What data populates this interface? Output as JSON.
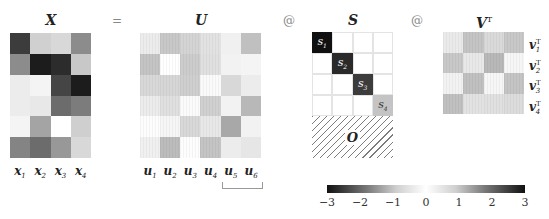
{
  "equation": {
    "titles": {
      "X": "X",
      "U": "U",
      "S": "S",
      "VT": "V",
      "VT_sup": "T"
    },
    "operators": {
      "equals": "=",
      "matmul1": "@",
      "matmul2": "@"
    }
  },
  "X": {
    "rows": 6,
    "cols": 4,
    "cells": [
      [
        "#3c3c3c",
        "#d0d0d0",
        "#d8d8d8",
        "#8c8c8c"
      ],
      [
        "#8c8c8c",
        "#1c1c1c",
        "#2c2c2c",
        "#c8c8c8"
      ],
      [
        "#ececec",
        "#f4f4f4",
        "#454545",
        "#1c1c1c"
      ],
      [
        "#ececec",
        "#e8e8e8",
        "#6c6c6c",
        "#7c7c7c"
      ],
      [
        "#f4f4f4",
        "#a4a4a4",
        "#ffffff",
        "#cfcfcf"
      ],
      [
        "#848484",
        "#6c6c6c",
        "#989898",
        "#d8d8d8"
      ]
    ],
    "col_labels": [
      {
        "base": "x",
        "sub": "1"
      },
      {
        "base": "x",
        "sub": "2"
      },
      {
        "base": "x",
        "sub": "3"
      },
      {
        "base": "x",
        "sub": "4"
      }
    ]
  },
  "U": {
    "rows": 6,
    "cols": 6,
    "hatched_cols": [
      4,
      5
    ],
    "cells": [
      [
        "#ececec",
        "#c8c8c8",
        "#d4d4d4",
        "#e2e2e2",
        "#f0f0f0",
        "#c0c0c0"
      ],
      [
        "#c4c4c4",
        "#ffffff",
        "#cccccc",
        "#e0e0e0",
        "#f2f2f2",
        "#f4f4f4"
      ],
      [
        "#d8d8d8",
        "#d6d6d6",
        "#cfcfcf",
        "#fafafa",
        "#d8d8d8",
        "#ececec"
      ],
      [
        "#ececec",
        "#e0e0e0",
        "#fbfbfb",
        "#d0d0d0",
        "#f2f2f2",
        "#b8b8b8"
      ],
      [
        "#fdfdfd",
        "#f6f6f6",
        "#d8d8d8",
        "#e8e8e8",
        "#a8a8a8",
        "#f2f2f2"
      ],
      [
        "#f0f0f0",
        "#bcbcbc",
        "#fdfdfd",
        "#c4c4c4",
        "#ececec",
        "#e6e6e6"
      ]
    ],
    "col_labels": [
      {
        "base": "u",
        "sub": "1"
      },
      {
        "base": "u",
        "sub": "2"
      },
      {
        "base": "u",
        "sub": "3"
      },
      {
        "base": "u",
        "sub": "4"
      },
      {
        "base": "u",
        "sub": "5"
      },
      {
        "base": "u",
        "sub": "6"
      }
    ]
  },
  "S": {
    "rows": 6,
    "cols": 4,
    "diagonal": [
      {
        "label": "s",
        "sub": "1",
        "color": "#101010",
        "text_color": "#ffffff"
      },
      {
        "label": "s",
        "sub": "2",
        "color": "#2a2a2a",
        "text_color": "#ffffff"
      },
      {
        "label": "s",
        "sub": "3",
        "color": "#3c3c3c",
        "text_color": "#ffffff"
      },
      {
        "label": "s",
        "sub": "4",
        "color": "#c4c4c4",
        "text_color": "#333333"
      }
    ],
    "zero_block_label": "O"
  },
  "VT": {
    "rows": 4,
    "cols": 4,
    "cells": [
      [
        "#eaeaea",
        "#c4c4c4",
        "#dadada",
        "#c8c8c8"
      ],
      [
        "#c8c8c8",
        "#e8e8e8",
        "#b8b8b8",
        "#f6f6f6"
      ],
      [
        "#f2f2f2",
        "#c0c0c0",
        "#f6f6f6",
        "#c4c4c4"
      ],
      [
        "#c0c0c0",
        "#e2e2e2",
        "#e0e0e0",
        "#dcdcdc"
      ]
    ],
    "row_labels": [
      {
        "base": "v",
        "sub": "1",
        "sup": "T"
      },
      {
        "base": "v",
        "sub": "2",
        "sup": "T"
      },
      {
        "base": "v",
        "sub": "3",
        "sup": "T"
      },
      {
        "base": "v",
        "sub": "4",
        "sup": "T"
      }
    ]
  },
  "colorbar": {
    "ticks": [
      "−3",
      "−2",
      "−1",
      "0",
      "1",
      "2",
      "3"
    ],
    "min": -3,
    "max": 3
  }
}
